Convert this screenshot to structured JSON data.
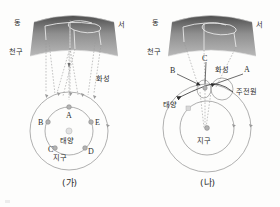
{
  "figure": {
    "title": "",
    "panels": [
      {
        "id": "panel-ga",
        "caption": "(가)",
        "model": "heliocentric",
        "celestial_sphere": {
          "label": "천구",
          "direction_left": "동",
          "direction_right": "서"
        },
        "labels": {
          "mars": "화성",
          "sun": "태양",
          "earth": "지구"
        },
        "earth_positions": [
          "A",
          "B",
          "C",
          "D",
          "E"
        ]
      },
      {
        "id": "panel-na",
        "caption": "(나)",
        "model": "geocentric-epicycle",
        "celestial_sphere": {
          "label": "천구",
          "direction_left": "동",
          "direction_right": "서"
        },
        "labels": {
          "mars": "화성",
          "sun": "태양",
          "earth": "지구",
          "epicycle": "주전원"
        },
        "mars_positions": [
          "A",
          "B",
          "C"
        ]
      }
    ]
  },
  "colors": {
    "sphere_dark": "#5a5a5a",
    "sphere_light": "#adadad",
    "orbit_line": "#8e8e8e",
    "sight_line": "#9a9a9a",
    "marker_fill": "#b3b3b3",
    "text": "#2b2b2b",
    "background": "#fdfdfc"
  }
}
